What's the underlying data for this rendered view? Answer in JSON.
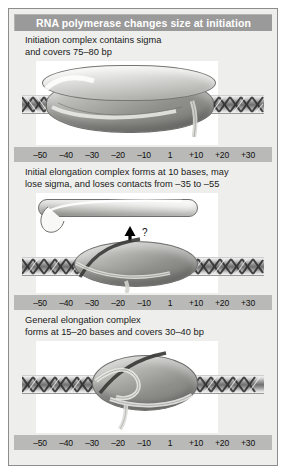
{
  "figure": {
    "title": "RNA polymerase changes size at initiation",
    "panels": [
      {
        "caption": "Initiation complex contains sigma\nand covers 75–80 bp",
        "scale_labels": [
          "–50",
          "–40",
          "–30",
          "–20",
          "–10",
          "1",
          "+10",
          "+20",
          "+30"
        ]
      },
      {
        "caption": "Initial elongation complex forms at 10 bases, may\nlose sigma, and loses contacts from –35 to –55",
        "annotation": "?",
        "scale_labels": [
          "–50",
          "–40",
          "–30",
          "–20",
          "–10",
          "1",
          "+10",
          "+20",
          "+30"
        ]
      },
      {
        "caption": "General elongation complex\nforms at 15–20 bases and covers 30–40 bp",
        "scale_labels": [
          "–50",
          "–40",
          "–30",
          "–20",
          "–10",
          "1",
          "+10",
          "+20",
          "+30"
        ]
      }
    ]
  },
  "colors": {
    "title_bar": "#9a9a9a",
    "panel_background": "#eeeeec",
    "ruler_band": "#b9b9b7",
    "text": "#1a1a1a"
  }
}
